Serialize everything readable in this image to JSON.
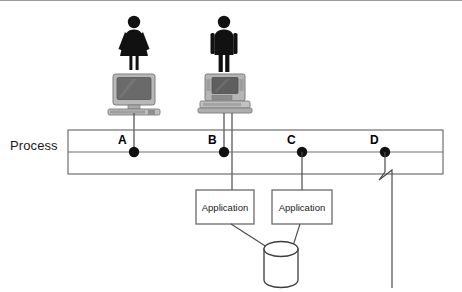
{
  "diagram": {
    "title_label": "Process",
    "background_color": "#ffffff",
    "line_color": "#4a4a4a",
    "node_color": "#111111",
    "actors": [
      {
        "id": "actor-female",
        "figure": "female-user-icon",
        "device": "desktop-computer-icon",
        "x": 134,
        "connects_to": "A"
      },
      {
        "id": "actor-male",
        "figure": "male-user-icon",
        "device": "workstation-computer-icon",
        "x": 224,
        "connects_to": "B"
      }
    ],
    "process_bar": {
      "name": "process-bar",
      "x": 68,
      "y": 130,
      "width": 375,
      "height": 44,
      "midline_y": 152
    },
    "nodes": [
      {
        "label": "A",
        "x": 134,
        "y": 152
      },
      {
        "label": "B",
        "x": 224,
        "y": 152
      },
      {
        "label": "C",
        "x": 302,
        "y": 152
      },
      {
        "label": "D",
        "x": 385,
        "y": 152
      }
    ],
    "applications": [
      {
        "label": "Application",
        "x": 196,
        "y": 190,
        "width": 58,
        "height": 34,
        "feeds_from_node": "B"
      },
      {
        "label": "Application",
        "x": 272,
        "y": 190,
        "width": 60,
        "height": 34,
        "feeds_from_node": "C"
      }
    ],
    "datastore": {
      "name": "database-cylinder",
      "cx": 281,
      "top_y": 243,
      "width": 34,
      "height": 44
    },
    "broken_connector": {
      "name": "broken-line-from-d",
      "from_node": "D",
      "symbol": "zigzag-break",
      "x": 385,
      "start_y": 152,
      "break_y": 178,
      "end_y": 288
    }
  }
}
